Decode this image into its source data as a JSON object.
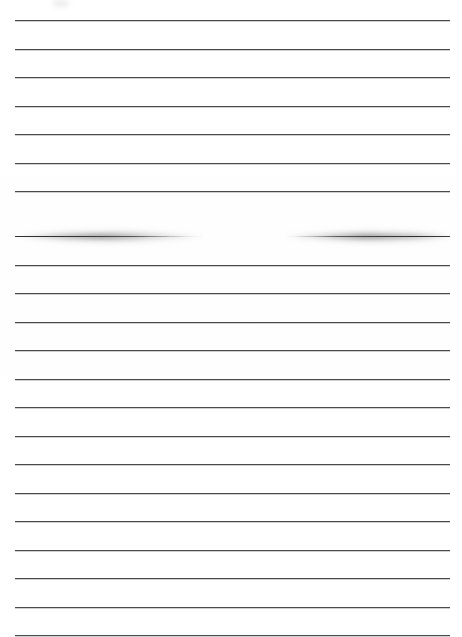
{
  "document": {
    "kind": "scanned-ruled-page",
    "title": "Blank ruled notebook page (scan)",
    "background_color": "#ffffff",
    "width": 462,
    "height": 637,
    "text_content": "",
    "visible_text": []
  },
  "ruling": {
    "line_color": "#4a4a4a",
    "line_thickness_px": 1,
    "line_count": 22,
    "first_line_y": 20,
    "line_spacing_px": 28.5,
    "margin_left_x": 15,
    "margin_right_x": 450,
    "line_y_positions": [
      20,
      48.5,
      77,
      105.5,
      134,
      162.5,
      191,
      236,
      264.5,
      293,
      321.5,
      350,
      378.5,
      407,
      435.5,
      464,
      492.5,
      521,
      549.5,
      578,
      606.5,
      635
    ]
  },
  "smudged_rule": {
    "label": "smudged-faded-rule",
    "y": 236,
    "description": "horizontal rule with heavy blurred ink smear and a near-white gap in the middle",
    "left_segment": {
      "start_x": 15,
      "end_x": 205,
      "color": "#2e2e2e"
    },
    "gap": {
      "start_x": 195,
      "end_x": 288
    },
    "right_segment": {
      "start_x": 282,
      "end_x": 450,
      "color": "#303030"
    },
    "halo_color": "#5a5a5a"
  },
  "artifact": {
    "label": "scan-edge-artifact",
    "x": 52,
    "y": 0,
    "width": 18,
    "height": 7,
    "color": "#a0a0aa"
  }
}
